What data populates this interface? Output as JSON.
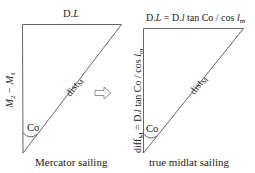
{
  "diagram": {
    "left_triangle": {
      "top_label": {
        "main": "D.",
        "italic": "L"
      },
      "vertical_label": {
        "m2": "M",
        "m2_sub": "2",
        "minus": " − ",
        "m1": "M",
        "m1_sub": "1"
      },
      "hypotenuse_label": {
        "main": "dist",
        "sub": "M"
      },
      "angle_label": "Co",
      "caption": "Mercator sailing"
    },
    "arrow": {
      "direction": "right",
      "icon": "hollow-right-arrow"
    },
    "right_triangle": {
      "top_label": {
        "p1": "D.",
        "p1_italic": "L",
        "p2": " = D.",
        "p2_italic": "l",
        "p3": " tan Co / cos ",
        "p3_italic": "l",
        "p3_sub": "m"
      },
      "vertical_label": {
        "p1": "diff",
        "p1_sub": "M",
        "p2": " = D.",
        "p2_italic": "l",
        "p3": " tan Co / cos ",
        "p3_italic": "l",
        "p3_sub": "m"
      },
      "hypotenuse_label": {
        "main": "dist",
        "sub": "M"
      },
      "angle_label": "Co",
      "caption": "true midlat sailing"
    },
    "colors": {
      "line": "#555555",
      "text": "#222222",
      "background": "#ffffff"
    }
  }
}
